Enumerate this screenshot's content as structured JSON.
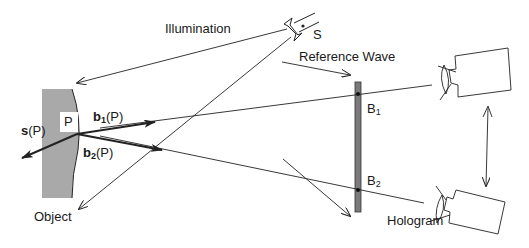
{
  "diagram": {
    "labels": {
      "illumination": "Illumination",
      "source": "S",
      "reference_wave": "Reference Wave",
      "object": "Object",
      "point": "P",
      "hologram": "Hologram",
      "s_vec": "s",
      "b1_vec": "b",
      "b2_vec": "b",
      "sub1": "1",
      "sub2": "2",
      "arg": "(P)",
      "B1": "B",
      "B2": "B"
    },
    "colors": {
      "line": "#222222",
      "object_fill": "#a9a9a9",
      "hologram_fill": "#7a7a7a"
    }
  }
}
